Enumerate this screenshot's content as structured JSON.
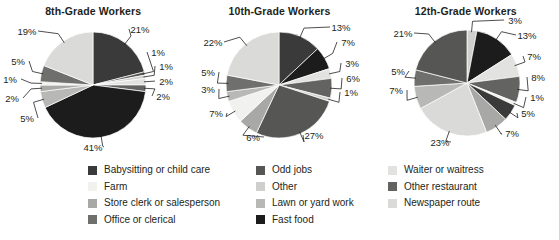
{
  "figure": {
    "type": "pie-chart-panel",
    "panel_count": 3
  },
  "colors": {
    "babysitting_or_child_care": "#3a3a3a",
    "farm": "#f1f1ef",
    "store_clerk_or_salesperson": "#a8a8a6",
    "office_or_clerical": "#6f6f6d",
    "odd_jobs": "#565654",
    "other": "#cfcfcd",
    "lawn_or_yard_work": "#b8b8b6",
    "fast_food": "#1c1c1c",
    "waiter_or_waitress": "#e2e2e0",
    "other_restaurant": "#636361",
    "newspaper_route": "#dadad8",
    "text": "#231f20",
    "leader_line": "#231f20",
    "background": "#ffffff"
  },
  "legend": {
    "columns": [
      {
        "items": [
          {
            "label": "Babysitting or child care",
            "color_key": "babysitting_or_child_care",
            "color": "#3a3a3a"
          },
          {
            "label": "Farm",
            "color_key": "farm",
            "color": "#f1f1ef"
          },
          {
            "label": "Store clerk or salesperson",
            "color_key": "store_clerk_or_salesperson",
            "color": "#a8a8a6"
          },
          {
            "label": "Office or clerical",
            "color_key": "office_or_clerical",
            "color": "#6f6f6d"
          }
        ]
      },
      {
        "items": [
          {
            "label": "Odd jobs",
            "color_key": "odd_jobs",
            "color": "#565654"
          },
          {
            "label": "Other",
            "color_key": "other",
            "color": "#cfcfcd"
          },
          {
            "label": "Lawn or yard work",
            "color_key": "lawn_or_yard_work",
            "color": "#b8b8b6"
          },
          {
            "label": "Fast food",
            "color_key": "fast_food",
            "color": "#1c1c1c"
          }
        ]
      },
      {
        "items": [
          {
            "label": "Waiter or waitress",
            "color_key": "waiter_or_waitress",
            "color": "#e2e2e0"
          },
          {
            "label": "Other restaurant",
            "color_key": "other_restaurant",
            "color": "#636361"
          },
          {
            "label": "Newspaper route",
            "color_key": "newspaper_route",
            "color": "#dadad8"
          }
        ]
      }
    ]
  },
  "chart_data": [
    {
      "type": "pie",
      "title": "8th-Grade Workers",
      "xlabel": "",
      "ylabel": "",
      "legend_position": "bottom-shared",
      "categories": [
        "Babysitting or child care",
        "Odd jobs",
        "Other",
        "Waiter or waitress",
        "Other restaurant",
        "Fast food",
        "Lawn or yard work",
        "Store clerk or salesperson",
        "Farm",
        "Office or clerical",
        "Newspaper route"
      ],
      "values": [
        21,
        1,
        1,
        2,
        2,
        41,
        5,
        2,
        1,
        5,
        19
      ],
      "labels": [
        "21%",
        "1%",
        "1%",
        "2%",
        "2%",
        "41%",
        "5%",
        "2%",
        "1%",
        "5%",
        "19%"
      ],
      "colors": [
        "#3a3a3a",
        "#565654",
        "#cfcfcd",
        "#e2e2e0",
        "#636361",
        "#1c1c1c",
        "#b8b8b6",
        "#a8a8a6",
        "#f1f1ef",
        "#6f6f6d",
        "#dadad8"
      ],
      "units": "percent",
      "total": 100
    },
    {
      "type": "pie",
      "title": "10th-Grade Workers",
      "xlabel": "",
      "ylabel": "",
      "legend_position": "bottom-shared",
      "categories": [
        "Babysitting or child care",
        "Fast food",
        "Waiter or waitress",
        "Other restaurant",
        "Newspaper route",
        "Odd jobs",
        "Store clerk or salesperson",
        "Farm",
        "Lawn or yard work",
        "Office or clerical",
        "Other"
      ],
      "values": [
        13,
        7,
        3,
        6,
        1,
        27,
        6,
        7,
        3,
        5,
        22
      ],
      "labels": [
        "13%",
        "7%",
        "3%",
        "6%",
        "1%",
        "27%",
        "6%",
        "7%",
        "3%",
        "5%",
        "22%"
      ],
      "colors": [
        "#3a3a3a",
        "#1c1c1c",
        "#e2e2e0",
        "#636361",
        "#cfcfcd",
        "#565654",
        "#a8a8a6",
        "#f1f1ef",
        "#b8b8b6",
        "#6f6f6d",
        "#dadad8"
      ],
      "units": "percent",
      "total": 100
    },
    {
      "type": "pie",
      "title": "12th-Grade Workers",
      "xlabel": "",
      "ylabel": "",
      "legend_position": "bottom-shared",
      "categories": [
        "Newspaper route",
        "Fast food",
        "Waiter or waitress",
        "Other restaurant",
        "Other",
        "Babysitting or child care",
        "Store clerk or salesperson",
        "Farm",
        "Lawn or yard work",
        "Office or clerical",
        "Odd jobs"
      ],
      "values": [
        3,
        13,
        7,
        8,
        1,
        5,
        7,
        23,
        7,
        5,
        21
      ],
      "labels": [
        "3%",
        "13%",
        "7%",
        "8%",
        "1%",
        "5%",
        "7%",
        "23%",
        "7%",
        "5%",
        "21%"
      ],
      "colors": [
        "#cfcfcd",
        "#1c1c1c",
        "#e2e2e0",
        "#636361",
        "#f1f1ef",
        "#3a3a3a",
        "#a8a8a6",
        "#dadad8",
        "#b8b8b6",
        "#6f6f6d",
        "#565654"
      ],
      "units": "percent",
      "total": 100
    }
  ],
  "annotations": {
    "chart1_labels": [
      {
        "text": "21%",
        "x": 140,
        "y": 29
      },
      {
        "text": "1%",
        "x": 158,
        "y": 52
      },
      {
        "text": "1%",
        "x": 166,
        "y": 66
      },
      {
        "text": "2%",
        "x": 166,
        "y": 81
      },
      {
        "text": "2%",
        "x": 163,
        "y": 96
      },
      {
        "text": "41%",
        "x": 93,
        "y": 147
      },
      {
        "text": "5%",
        "x": 27,
        "y": 118
      },
      {
        "text": "2%",
        "x": 12,
        "y": 98
      },
      {
        "text": "1%",
        "x": 10,
        "y": 79
      },
      {
        "text": "5%",
        "x": 18,
        "y": 61
      },
      {
        "text": "19%",
        "x": 27,
        "y": 31
      }
    ],
    "chart2_labels": [
      {
        "text": "13%",
        "x": 341,
        "y": 27
      },
      {
        "text": "7%",
        "x": 348,
        "y": 42
      },
      {
        "text": "3%",
        "x": 352,
        "y": 63
      },
      {
        "text": "6%",
        "x": 353,
        "y": 78
      },
      {
        "text": "1%",
        "x": 351,
        "y": 92
      },
      {
        "text": "27%",
        "x": 314,
        "y": 135
      },
      {
        "text": "6%",
        "x": 253,
        "y": 137
      },
      {
        "text": "7%",
        "x": 216,
        "y": 113
      },
      {
        "text": "3%",
        "x": 208,
        "y": 89
      },
      {
        "text": "5%",
        "x": 208,
        "y": 72
      },
      {
        "text": "22%",
        "x": 213,
        "y": 42
      }
    ],
    "chart3_labels": [
      {
        "text": "3%",
        "x": 515,
        "y": 20
      },
      {
        "text": "13%",
        "x": 527,
        "y": 35
      },
      {
        "text": "7%",
        "x": 534,
        "y": 56
      },
      {
        "text": "8%",
        "x": 538,
        "y": 77
      },
      {
        "text": "1%",
        "x": 537,
        "y": 97
      },
      {
        "text": "5%",
        "x": 528,
        "y": 113
      },
      {
        "text": "7%",
        "x": 512,
        "y": 133
      },
      {
        "text": "23%",
        "x": 440,
        "y": 142
      },
      {
        "text": "7%",
        "x": 396,
        "y": 90
      },
      {
        "text": "5%",
        "x": 398,
        "y": 71
      },
      {
        "text": "21%",
        "x": 403,
        "y": 33
      }
    ]
  }
}
